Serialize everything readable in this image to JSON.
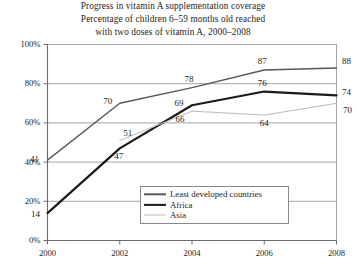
{
  "chart_data": {
    "type": "line",
    "title": "Progress in vitamin A supplementation coverage",
    "subtitle_line1": "Percentage of children 6–59 months old reached",
    "subtitle_line2": "with two doses of vitamin A, 2000–2008",
    "xlabel": "",
    "ylabel": "",
    "x": [
      2000,
      2002,
      2004,
      2006,
      2008
    ],
    "xtick_labels": [
      "2000",
      "2002",
      "2004",
      "2006",
      "2008"
    ],
    "ytick_labels": [
      "0%",
      "20%",
      "40%",
      "60%",
      "80%",
      "100%"
    ],
    "ytick_values": [
      0,
      20,
      40,
      60,
      80,
      100
    ],
    "ylim": [
      0,
      100
    ],
    "xlim": [
      2000,
      2008
    ],
    "grid": true,
    "legend_position": "bottom-center",
    "series": [
      {
        "name": "Least developed countries",
        "color": "#58585a",
        "width": 1.4,
        "x": [
          2000,
          2002,
          2004,
          2006,
          2008
        ],
        "values": [
          41,
          70,
          78,
          87,
          88
        ],
        "labels": [
          "41",
          "70",
          "78",
          "87",
          "88"
        ]
      },
      {
        "name": "Africa",
        "color": "#1a1a1a",
        "width": 2.2,
        "x": [
          2000,
          2002,
          2004,
          2006,
          2008
        ],
        "values": [
          14,
          47,
          69,
          76,
          74
        ],
        "labels": [
          "14",
          "47",
          "69",
          "76",
          "74"
        ]
      },
      {
        "name": "Asia",
        "color": "#b9b9b9",
        "width": 1.0,
        "x": [
          2002,
          2004,
          2006,
          2008
        ],
        "values": [
          51,
          66,
          64,
          70
        ],
        "labels": [
          "51",
          "66",
          "64",
          "70"
        ]
      }
    ],
    "annotations": [
      {
        "text": "41",
        "x": 2000,
        "y": 41,
        "dx": -13,
        "dy": -1
      },
      {
        "text": "70",
        "x": 2002,
        "y": 70,
        "dx": -12,
        "dy": -2
      },
      {
        "text": "78",
        "x": 2004,
        "y": 78,
        "dx": -3,
        "dy": -8
      },
      {
        "text": "87",
        "x": 2006,
        "y": 87,
        "dx": -2,
        "dy": -8
      },
      {
        "text": "88",
        "x": 2008,
        "y": 88,
        "dx": 10,
        "dy": -7
      },
      {
        "text": "14",
        "x": 2000,
        "y": 14,
        "dx": -12,
        "dy": 1
      },
      {
        "text": "47",
        "x": 2002,
        "y": 47,
        "dx": -1,
        "dy": 8
      },
      {
        "text": "69",
        "x": 2004,
        "y": 69,
        "dx": -13,
        "dy": -2
      },
      {
        "text": "76",
        "x": 2006,
        "y": 76,
        "dx": -2,
        "dy": -8
      },
      {
        "text": "74",
        "x": 2008,
        "y": 74,
        "dx": 10,
        "dy": -3
      },
      {
        "text": "51",
        "x": 2002,
        "y": 51,
        "dx": 8,
        "dy": -7
      },
      {
        "text": "66",
        "x": 2004,
        "y": 66,
        "dx": -12,
        "dy": 8
      },
      {
        "text": "64",
        "x": 2006,
        "y": 64,
        "dx": 0,
        "dy": 8
      },
      {
        "text": "70",
        "x": 2008,
        "y": 70,
        "dx": 11,
        "dy": 7
      }
    ],
    "legend_entries": [
      {
        "label": "Least developed countries",
        "swatch": "ldc"
      },
      {
        "label": "Africa",
        "swatch": "africa"
      },
      {
        "label": "Asia",
        "swatch": "asia"
      }
    ]
  }
}
